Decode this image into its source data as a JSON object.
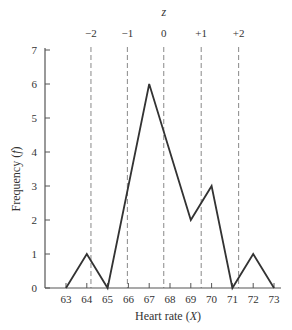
{
  "chart_data": {
    "type": "line",
    "title": "",
    "xlabel": "Heart rate (X)",
    "xlabel_plain": "Heart rate (",
    "xlabel_var": "X",
    "xlabel_close": ")",
    "ylabel": "Frequency (f)",
    "ylabel_plain": "Frequency (",
    "ylabel_var": "f",
    "ylabel_close": ")",
    "x": [
      63,
      64,
      65,
      66,
      67,
      68,
      69,
      70,
      71,
      72,
      73
    ],
    "x_tick_labels": [
      "63",
      "64",
      "65",
      "66",
      "67",
      "68",
      "69",
      "70",
      "71",
      "72",
      "73"
    ],
    "y_ticks": [
      0,
      1,
      2,
      3,
      4,
      5,
      6,
      7
    ],
    "y_tick_labels": [
      "0",
      "1",
      "2",
      "3",
      "4",
      "5",
      "6",
      "7"
    ],
    "series": [
      {
        "name": "Frequency polygon",
        "points": [
          [
            63,
            0
          ],
          [
            64,
            1
          ],
          [
            65,
            0
          ],
          [
            67,
            6
          ],
          [
            69,
            2
          ],
          [
            70,
            3
          ],
          [
            71,
            0
          ],
          [
            72,
            1
          ],
          [
            73,
            0
          ]
        ]
      }
    ],
    "xlim": [
      62.3,
      73.3
    ],
    "ylim": [
      0,
      7
    ],
    "grid": false,
    "z_axis": {
      "title": "z",
      "lines": [
        {
          "label": "−2",
          "x": 64.2
        },
        {
          "label": "−1",
          "x": 65.95
        },
        {
          "label": "0",
          "x": 67.7
        },
        {
          "label": "+1",
          "x": 69.5
        },
        {
          "label": "+2",
          "x": 71.3
        }
      ]
    }
  },
  "colors": {
    "line": "#333333",
    "axis": "#555555",
    "dashed": "#888888"
  }
}
